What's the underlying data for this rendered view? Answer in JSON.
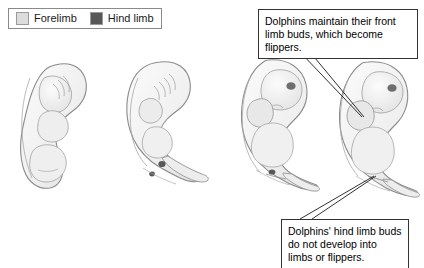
{
  "figure": {
    "background_color": "#ffffff"
  },
  "legend": {
    "items": [
      {
        "label": "Forelimb",
        "color": "#dcdcdc",
        "icon": "color-swatch-icon"
      },
      {
        "label": "Hind limb",
        "color": "#585858",
        "icon": "color-swatch-icon"
      }
    ]
  },
  "callouts": [
    {
      "id": "front-limb-note",
      "text": "Dolphins maintain their front limb buds, which become flippers.",
      "position": "top-right"
    },
    {
      "id": "hind-limb-note",
      "text": "Dolphins' hind limb buds do not develop into limbs or flippers.",
      "position": "bottom-right"
    }
  ],
  "embryos": [
    {
      "stage": 1,
      "label": "embryo-stage-1",
      "has_tail": false,
      "has_eye": false,
      "hind_limb_bud": false
    },
    {
      "stage": 2,
      "label": "embryo-stage-2",
      "has_tail": true,
      "has_eye": false,
      "hind_limb_bud": true
    },
    {
      "stage": 3,
      "label": "embryo-stage-3",
      "has_tail": true,
      "has_eye": true,
      "hind_limb_bud": true
    },
    {
      "stage": 4,
      "label": "embryo-stage-4",
      "has_tail": true,
      "has_eye": true,
      "hind_limb_bud": true
    }
  ],
  "colors": {
    "embryo_fill": "#f2f2f2",
    "embryo_outline": "#8c8c8c",
    "embryo_shade": "#e2e2e2",
    "hind_bud": "#585858",
    "eye": "#6e6e6e",
    "leader_line": "#1a1a1a",
    "box_border": "#333333"
  }
}
